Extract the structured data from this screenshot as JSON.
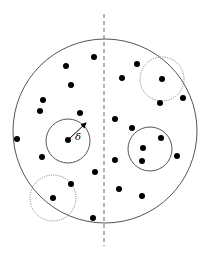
{
  "diagram": {
    "canvas": {
      "width": 205,
      "height": 255
    },
    "colors": {
      "background": "#ffffff",
      "main_circle": "#555555",
      "solid_circles": "#555555",
      "dotted_circles": "#888888",
      "divider": "#666666",
      "points": "#000000"
    },
    "main_circle": {
      "cx": 105,
      "cy": 131,
      "r": 92
    },
    "divider": {
      "x": 104,
      "y1": 14,
      "y2": 246
    },
    "solid_circles": [
      {
        "name": "delta-circle-left",
        "cx": 68,
        "cy": 141,
        "r": 22
      },
      {
        "name": "delta-circle-right",
        "cx": 150,
        "cy": 149,
        "r": 22
      }
    ],
    "dotted_circles": [
      {
        "name": "boundary-circle-top-right",
        "cx": 162,
        "cy": 79,
        "r": 22
      },
      {
        "name": "boundary-circle-bottom-left",
        "cx": 53,
        "cy": 198,
        "r": 23
      }
    ],
    "radius_arrow": {
      "x1": 69,
      "y1": 139,
      "x2": 86,
      "y2": 123
    },
    "radius_label": {
      "text": "δ",
      "x": 75,
      "y": 140
    },
    "points_left": [
      [
        94,
        57
      ],
      [
        66,
        66
      ],
      [
        71,
        85
      ],
      [
        43,
        100
      ],
      [
        40,
        111
      ],
      [
        80,
        113
      ],
      [
        17,
        139
      ],
      [
        68,
        140
      ],
      [
        42,
        157
      ],
      [
        95,
        172
      ],
      [
        71,
        184
      ],
      [
        53,
        198
      ],
      [
        93,
        218
      ]
    ],
    "points_right": [
      [
        137,
        64
      ],
      [
        122,
        78
      ],
      [
        162,
        79
      ],
      [
        160,
        103
      ],
      [
        183,
        98
      ],
      [
        115,
        119
      ],
      [
        132,
        128
      ],
      [
        161,
        138
      ],
      [
        143,
        148
      ],
      [
        115,
        160
      ],
      [
        142,
        161
      ],
      [
        177,
        156
      ],
      [
        119,
        189
      ],
      [
        142,
        196
      ]
    ],
    "point_radius": 3
  }
}
